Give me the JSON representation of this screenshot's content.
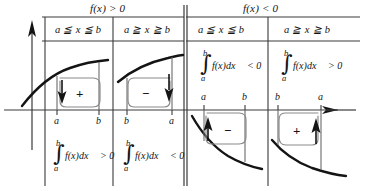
{
  "figure": {
    "name": "sign-of-definite-integral-table",
    "axes": {
      "y_axis_name": "y-axis-arrow",
      "x_axis_name": "x-axis-arrow"
    },
    "headers": [
      {
        "id": "left-group",
        "title": "f(x) > 0"
      },
      {
        "id": "right-group",
        "title": "f(x) < 0"
      }
    ],
    "columns": [
      {
        "id": "col-1",
        "condition": "a ≦ x ≦ b"
      },
      {
        "id": "col-2",
        "condition": "a ≧ x ≧ b"
      },
      {
        "id": "col-3",
        "condition": "a ≦ x ≦ b"
      },
      {
        "id": "col-4",
        "condition": "a ≧ x ≧ b"
      }
    ],
    "cells": [
      {
        "id": "cell-1",
        "curve_position": "above-axis",
        "loop_sign": "+",
        "arrow_direction": "down",
        "arrow_side": "left",
        "tick_left": "a",
        "tick_right": "b",
        "integral": {
          "upper_limit": "b",
          "lower_limit": "a",
          "body": "f(x)dx",
          "relation": "> 0",
          "placement": "below-axis"
        }
      },
      {
        "id": "cell-2",
        "curve_position": "above-axis",
        "loop_sign": "−",
        "arrow_direction": "down",
        "arrow_side": "right",
        "tick_left": "b",
        "tick_right": "a",
        "integral": {
          "upper_limit": "b",
          "lower_limit": "a",
          "body": "f(x)dx",
          "relation": "< 0",
          "placement": "below-axis"
        }
      },
      {
        "id": "cell-3",
        "curve_position": "below-axis",
        "loop_sign": "−",
        "arrow_direction": "up",
        "arrow_side": "left",
        "tick_left": "a",
        "tick_right": "b",
        "integral": {
          "upper_limit": "b",
          "lower_limit": "a",
          "body": "f(x)dx",
          "relation": "< 0",
          "placement": "above-axis"
        }
      },
      {
        "id": "cell-4",
        "curve_position": "below-axis",
        "loop_sign": "+",
        "arrow_direction": "up",
        "arrow_side": "right",
        "tick_left": "b",
        "tick_right": "a",
        "integral": {
          "upper_limit": "b",
          "lower_limit": "a",
          "body": "f(x)dx",
          "relation": "> 0",
          "placement": "above-axis"
        }
      }
    ],
    "colors": {
      "ink": "#141414",
      "rule": "#3a3a3a",
      "loop": "#6a6a6a",
      "background": "#ffffff"
    }
  }
}
